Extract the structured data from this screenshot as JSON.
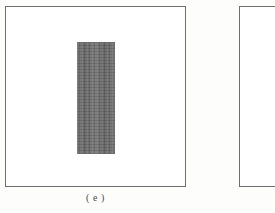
{
  "figure": {
    "caption_e": "( e )",
    "background_color": "#fdfdfb",
    "panels": [
      {
        "id": "e",
        "label": "( e )",
        "border_color": "#6f6f6f",
        "fill_color": "#ffffff",
        "content_label": "gray textured specimen block",
        "content_color": "#6a6a6a"
      },
      {
        "id": "next",
        "label": "",
        "border_color": "#6f6f6f",
        "fill_color": "#ffffff",
        "content_label": "",
        "content_color": ""
      }
    ]
  }
}
